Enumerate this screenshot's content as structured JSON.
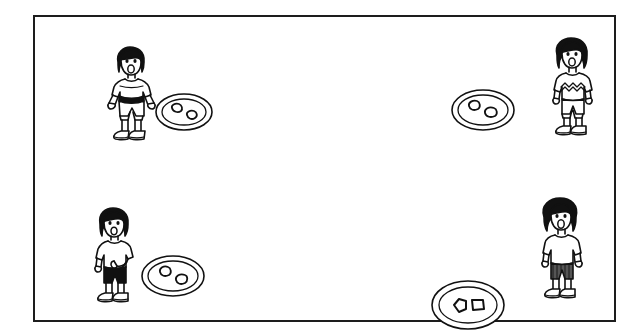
{
  "image": {
    "type": "line-drawing-illustration",
    "style": "black and white hand-drawn cartoon, worksheet / textbook figure",
    "background_color": "#ffffff",
    "ink_color": "#111111",
    "frame": {
      "present": true,
      "shape": "rectangle",
      "stroke_color": "#1d1d1d",
      "stroke_width_px": 2,
      "x": 33,
      "y": 15,
      "width": 583,
      "height": 307
    },
    "caption": "",
    "title": "",
    "visible_text": []
  },
  "scene": {
    "description": "Four children standing, each beside an oval plate holding two small objects",
    "child_count": 4,
    "plate_count": 4,
    "items_per_plate": 2,
    "total_items": 8
  },
  "groups": [
    {
      "id": "top-left",
      "label": "top-left-group",
      "child": {
        "name": "child-top-left",
        "pose": "standing, arms out, mouth open",
        "mouth": "open",
        "hair": "dark bob",
        "shirt": "striped t-shirt, white with dark belt band",
        "shirt_fill": "#ffffff",
        "shorts": "light shorts",
        "shorts_fill": "#ffffff",
        "shoes": "dark outlined shoes",
        "x": 98,
        "y": 44,
        "width": 56,
        "height": 94
      },
      "plate": {
        "name": "plate-top-left",
        "shape": "oval, double outline",
        "items": 2,
        "item_shape": "small rounded blobs",
        "x": 152,
        "y": 88,
        "width": 56,
        "height": 40
      }
    },
    {
      "id": "top-right",
      "label": "top-right-group",
      "child": {
        "name": "child-top-right",
        "pose": "standing, arms down at sides, mouth open",
        "mouth": "open",
        "hair": "dark bob",
        "shirt": "t-shirt with zigzag pattern across chest",
        "shirt_fill": "#ffffff",
        "shorts": "light shorts",
        "shorts_fill": "#ffffff",
        "shoes": "dark outlined shoes",
        "x": 508,
        "y": 38,
        "width": 56,
        "height": 96
      },
      "plate": {
        "name": "plate-top-right",
        "shape": "oval, double outline",
        "items": 2,
        "item_shape": "small rounded blobs",
        "x": 448,
        "y": 84,
        "width": 62,
        "height": 44
      }
    },
    {
      "id": "bottom-left",
      "label": "bottom-left-group",
      "child": {
        "name": "child-bottom-left",
        "pose": "standing, one arm bent across body, mouth open",
        "mouth": "open",
        "hair": "dark bob",
        "shirt": "plain white t-shirt",
        "shirt_fill": "#ffffff",
        "shorts": "solid black shorts",
        "shorts_fill": "#111111",
        "shoes": "dark outlined shoes",
        "x": 86,
        "y": 208,
        "width": 56,
        "height": 92
      },
      "plate": {
        "name": "plate-bottom-left",
        "shape": "oval, double outline",
        "items": 2,
        "item_shape": "small rounded blobs",
        "x": 136,
        "y": 252,
        "width": 62,
        "height": 44
      }
    },
    {
      "id": "bottom-right",
      "label": "bottom-right-group",
      "child": {
        "name": "child-bottom-right",
        "pose": "standing, arms down at sides, mouth open",
        "mouth": "open",
        "hair": "dark curly bob",
        "shirt": "plain white t-shirt",
        "shirt_fill": "#ffffff",
        "shorts": "dark striped shorts",
        "shorts_fill": "#555555",
        "shoes": "dark outlined shoes",
        "x": 498,
        "y": 186,
        "width": 58,
        "height": 100
      },
      "plate": {
        "name": "plate-bottom-right",
        "shape": "oval, double outline",
        "items": 2,
        "item_shape": "angular rounded blobs",
        "x": 428,
        "y": 268,
        "width": 70,
        "height": 50
      }
    }
  ]
}
